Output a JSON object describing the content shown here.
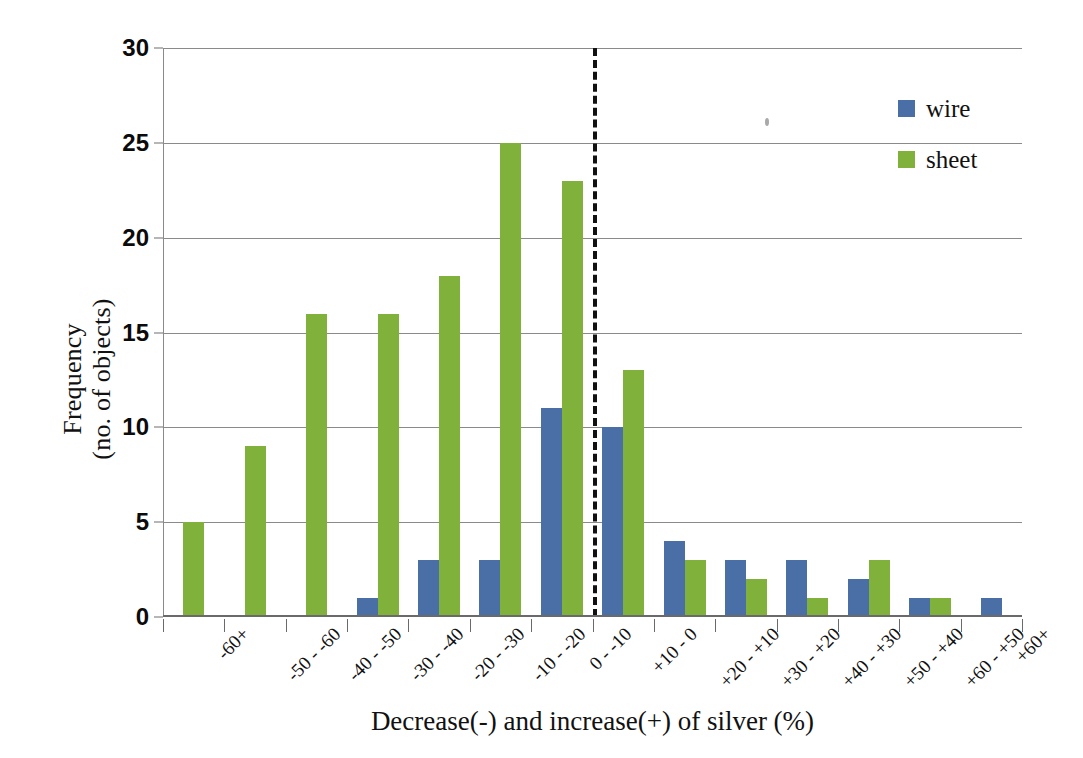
{
  "chart_data": {
    "type": "bar",
    "title": "",
    "subtitle": "",
    "xlabel": "Decrease(-) and increase(+) of silver (%)",
    "ylabel": "Frequency\n(no. of objects)",
    "ylabel_line1": "Frequency",
    "ylabel_line2": "(no. of objects)",
    "categories": [
      "-60+",
      "-50 - -60",
      "-40 - -50",
      "-30 - -40",
      "-20 - -30",
      "-10 - -20",
      "0 - -10",
      "+10 - 0",
      "+20 - +10",
      "+30 - +20",
      "+40 - +30",
      "+50 - +40",
      "+60 - +50",
      "+60+"
    ],
    "series": [
      {
        "name": "wire",
        "color": "#4a6fa6",
        "values": [
          0,
          0,
          0,
          1,
          3,
          3,
          11,
          10,
          4,
          3,
          3,
          2,
          1,
          1
        ]
      },
      {
        "name": "sheet",
        "color": "#7fb13b",
        "values": [
          5,
          9,
          16,
          16,
          18,
          25,
          23,
          13,
          3,
          2,
          1,
          3,
          1,
          0
        ]
      }
    ],
    "ylim": [
      0,
      30
    ],
    "yticks": [
      0,
      5,
      10,
      15,
      20,
      25,
      30
    ],
    "ytick_labels": [
      "0",
      "5",
      "10",
      "15",
      "20",
      "25",
      "30"
    ],
    "grid": true,
    "legend_position": "top-right",
    "annotations": [
      {
        "type": "vertical-dashed-line",
        "name": "zero-divider",
        "between_categories": [
          "0 - -10",
          "+10 - 0"
        ],
        "label": ""
      }
    ]
  },
  "legend": {
    "items": [
      {
        "label": "wire",
        "color": "#4a6fa6"
      },
      {
        "label": "sheet",
        "color": "#7fb13b"
      }
    ]
  },
  "axes": {
    "y_title_line1": "Frequency",
    "y_title_line2": "(no. of objects)",
    "x_title": "Decrease(-) and increase(+) of silver (%)"
  }
}
